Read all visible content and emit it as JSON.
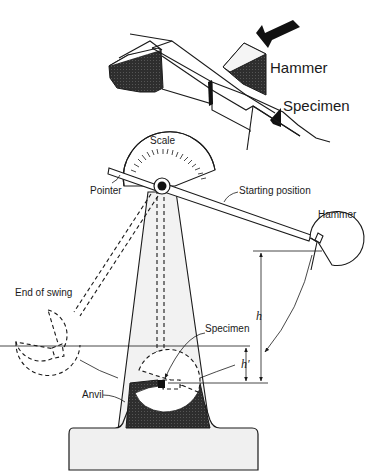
{
  "figure": {
    "inset_labels": {
      "hammer": "Hammer",
      "specimen": "Specimen"
    },
    "main_labels": {
      "scale": "Scale",
      "pointer": "Pointer",
      "starting_position": "Starting position",
      "hammer": "Hammer",
      "end_of_swing": "End of swing",
      "specimen": "Specimen",
      "anvil": "Anvil",
      "h": "h",
      "h_prime": "h′"
    },
    "colors": {
      "ink": "#1a1a1a",
      "shade_dark": "#2a2a2a",
      "tower_fill": "#f2f2f2",
      "background": "#ffffff"
    }
  }
}
